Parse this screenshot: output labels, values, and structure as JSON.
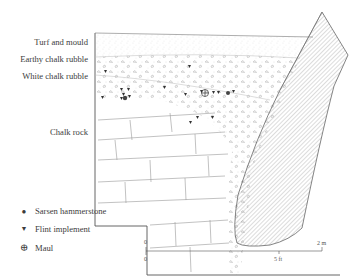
{
  "section": {
    "layers": [
      {
        "label": "Turf and mould"
      },
      {
        "label": "Earthy chalk rubble"
      },
      {
        "label": "White chalk rubble"
      },
      {
        "label": "Chalk rock"
      }
    ]
  },
  "legend": {
    "items": [
      {
        "symbol": "filled-circle",
        "glyph": "●",
        "label": "Sarsen hammerstone"
      },
      {
        "symbol": "filled-triangle-down",
        "glyph": "▼",
        "label": "Flint implement"
      },
      {
        "symbol": "circled-plus",
        "glyph": "⊕",
        "label": "Maul"
      }
    ]
  },
  "scale": {
    "metric_start": "0",
    "metric_end": "2 m",
    "imperial_start": "0",
    "imperial_mid": "5 ft"
  },
  "colors": {
    "line": "#555555",
    "stipple": "#9a9a9a",
    "hatch": "#8a8a8a",
    "symbol": "#333333"
  }
}
